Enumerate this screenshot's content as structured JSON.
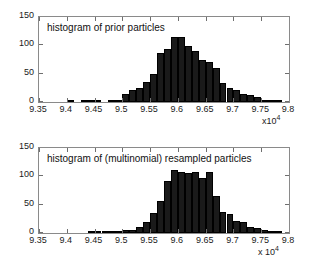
{
  "figure": {
    "background": "#ffffff",
    "bar_color": "#1a1a1a",
    "axis_color": "#8a8a8a"
  },
  "chart_data": [
    {
      "type": "bar",
      "title": "histogram of prior particles",
      "panel": "top",
      "xlabel": "",
      "ylabel": "",
      "exponent_label": "x10",
      "exponent_power": "4",
      "x_scale_factor": 10000,
      "xlim": [
        9.35,
        9.8
      ],
      "ylim": [
        0,
        150
      ],
      "xticks": [
        9.35,
        9.4,
        9.45,
        9.5,
        9.55,
        9.6,
        9.65,
        9.7,
        9.75,
        9.8
      ],
      "xtick_labels": [
        "9.35",
        "9.4",
        "9.45",
        "9.5",
        "9.55",
        "9.6",
        "9.65",
        "9.7",
        "9.75",
        "9.8"
      ],
      "yticks": [
        0,
        50,
        100,
        150
      ],
      "ytick_labels": [
        "0",
        "50",
        "100",
        "150"
      ],
      "grid": false,
      "legend": null,
      "bin_width": 0.0125,
      "bin_centers": [
        9.39375,
        9.40625,
        9.41875,
        9.43125,
        9.44375,
        9.45625,
        9.46875,
        9.48125,
        9.49375,
        9.50625,
        9.51875,
        9.53125,
        9.54375,
        9.55625,
        9.56875,
        9.58125,
        9.59375,
        9.60625,
        9.61875,
        9.63125,
        9.64375,
        9.65625,
        9.66875,
        9.68125,
        9.69375,
        9.70625,
        9.71875,
        9.73125,
        9.74375,
        9.75625,
        9.76875,
        9.78125
      ],
      "values": [
        0,
        1,
        0,
        1,
        1,
        1,
        0,
        3,
        2,
        14,
        22,
        25,
        35,
        49,
        86,
        94,
        115,
        114,
        99,
        90,
        75,
        70,
        60,
        33,
        25,
        21,
        14,
        13,
        8,
        3,
        2,
        1
      ]
    },
    {
      "type": "bar",
      "title": "histogram of (multinomial) resampled particles",
      "panel": "bottom",
      "xlabel": "",
      "ylabel": "",
      "exponent_label": "x 10",
      "exponent_power": "4",
      "x_scale_factor": 10000,
      "xlim": [
        9.35,
        9.8
      ],
      "ylim": [
        0,
        150
      ],
      "xticks": [
        9.35,
        9.4,
        9.45,
        9.5,
        9.55,
        9.6,
        9.65,
        9.7,
        9.75,
        9.8
      ],
      "xtick_labels": [
        "9.35",
        "9.4",
        "9.45",
        "9.5",
        "9.55",
        "9.6",
        "9.65",
        "9.7",
        "9.75",
        "9.8"
      ],
      "yticks": [
        0,
        50,
        100,
        150
      ],
      "ytick_labels": [
        "0",
        "50",
        "100",
        "150"
      ],
      "grid": false,
      "legend": null,
      "bin_width": 0.0125,
      "bin_centers": [
        9.44375,
        9.45625,
        9.46875,
        9.48125,
        9.49375,
        9.50625,
        9.51875,
        9.53125,
        9.54375,
        9.55625,
        9.56875,
        9.58125,
        9.59375,
        9.60625,
        9.61875,
        9.63125,
        9.64375,
        9.65625,
        9.66875,
        9.68125,
        9.69375,
        9.70625,
        9.71875,
        9.73125,
        9.74375,
        9.75625,
        9.76875,
        9.78125
      ],
      "values": [
        1,
        1,
        1,
        1,
        2,
        5,
        6,
        11,
        20,
        35,
        57,
        91,
        111,
        107,
        106,
        107,
        97,
        108,
        65,
        37,
        34,
        22,
        20,
        11,
        8,
        6,
        3,
        1
      ]
    }
  ]
}
